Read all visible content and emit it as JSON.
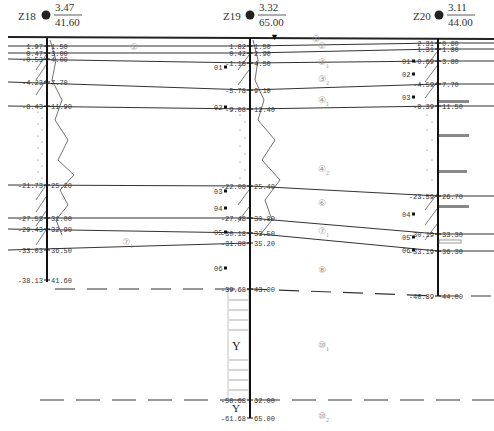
{
  "boreholes": [
    {
      "id": "Z18",
      "elevation": "3.47",
      "depth": "41.60",
      "x": 47,
      "layers": [
        {
          "elev": "1.97",
          "depth": "1.50",
          "y": 46
        },
        {
          "elev": "0.47",
          "depth": "3.00",
          "y": 53
        },
        {
          "elev": "-0.53",
          "depth": "4.00",
          "y": 59
        },
        {
          "elev": "-4.23",
          "depth": "7.70",
          "y": 82
        },
        {
          "elev": "-8.43",
          "depth": "11.90",
          "y": 106
        },
        {
          "elev": "-21.73",
          "depth": "25.20",
          "y": 185
        },
        {
          "elev": "-27.53",
          "depth": "31.00",
          "y": 218
        },
        {
          "elev": "-29.43",
          "depth": "32.90",
          "y": 229
        },
        {
          "elev": "-33.03",
          "depth": "36.50",
          "y": 250
        },
        {
          "elev": "-38.13",
          "depth": "41.60",
          "y": 280
        }
      ],
      "samples": []
    },
    {
      "id": "Z19",
      "elevation": "3.32",
      "depth": "65.00",
      "x": 250,
      "layers": [
        {
          "elev": "1.82",
          "depth": "1.50",
          "y": 46
        },
        {
          "elev": "0.42",
          "depth": "2.90",
          "y": 53
        },
        {
          "elev": "-1.18",
          "depth": "4.50",
          "y": 63
        },
        {
          "elev": "-5.78",
          "depth": "9.10",
          "y": 90
        },
        {
          "elev": "-9.08",
          "depth": "12.40",
          "y": 109
        },
        {
          "elev": "-22.08",
          "depth": "25.40",
          "y": 186
        },
        {
          "elev": "-27.48",
          "depth": "30.80",
          "y": 218
        },
        {
          "elev": "-30.18",
          "depth": "33.50",
          "y": 233
        },
        {
          "elev": "-31.88",
          "depth": "35.20",
          "y": 243
        },
        {
          "elev": "-39.68",
          "depth": "43.00",
          "y": 289
        },
        {
          "elev": "-58.68",
          "depth": "62.00",
          "y": 400
        },
        {
          "elev": "-61.68",
          "depth": "65.00",
          "y": 418
        }
      ],
      "samples": [
        {
          "label": "01",
          "y": 67
        },
        {
          "label": "02",
          "y": 107
        },
        {
          "label": "03",
          "y": 191
        },
        {
          "label": "04",
          "y": 208
        },
        {
          "label": "05",
          "y": 232
        },
        {
          "label": "06",
          "y": 268
        }
      ]
    },
    {
      "id": "Z20",
      "elevation": "3.11",
      "depth": "44.00",
      "x": 438,
      "layers": [
        {
          "elev": "2.31",
          "depth": "0.80",
          "y": 43
        },
        {
          "elev": "1.31",
          "depth": "1.80",
          "y": 49
        },
        {
          "elev": "-0.69",
          "depth": "3.80",
          "y": 61
        },
        {
          "elev": "-4.59",
          "depth": "7.70",
          "y": 84
        },
        {
          "elev": "-8.39",
          "depth": "11.50",
          "y": 106
        },
        {
          "elev": "-23.59",
          "depth": "26.70",
          "y": 196
        },
        {
          "elev": "-30.19",
          "depth": "33.30",
          "y": 234
        },
        {
          "elev": "-33.19",
          "depth": "36.30",
          "y": 251
        },
        {
          "elev": "-40.89",
          "depth": "44.00",
          "y": 296
        }
      ],
      "samples": [
        {
          "label": "01",
          "y": 61
        },
        {
          "label": "02",
          "y": 74
        },
        {
          "label": "03",
          "y": 97
        },
        {
          "label": "04",
          "y": 214
        },
        {
          "label": "05",
          "y": 237
        },
        {
          "label": "06",
          "y": 250
        }
      ]
    }
  ],
  "strata_labels": [
    {
      "main": "①",
      "sub": "",
      "x": 312,
      "y": 42
    },
    {
      "main": "②",
      "sub": "",
      "x": 130,
      "y": 50
    },
    {
      "main": "②",
      "sub": "",
      "x": 318,
      "y": 49
    },
    {
      "main": "②",
      "sub": "1",
      "x": 318,
      "y": 65
    },
    {
      "main": "③",
      "sub": "2",
      "x": 318,
      "y": 82
    },
    {
      "main": "④",
      "sub": "1",
      "x": 318,
      "y": 103
    },
    {
      "main": "④",
      "sub": "2",
      "x": 318,
      "y": 172
    },
    {
      "main": "⑥",
      "sub": "",
      "x": 318,
      "y": 206
    },
    {
      "main": "⑦",
      "sub": "1",
      "x": 318,
      "y": 234
    },
    {
      "main": "⑦",
      "sub": "1",
      "x": 122,
      "y": 245
    },
    {
      "main": "⑧",
      "sub": "",
      "x": 318,
      "y": 273
    },
    {
      "main": "⑩",
      "sub": "1",
      "x": 318,
      "y": 348
    },
    {
      "main": "⑩",
      "sub": "2",
      "x": 318,
      "y": 419
    }
  ],
  "water_level_marker": "▼"
}
